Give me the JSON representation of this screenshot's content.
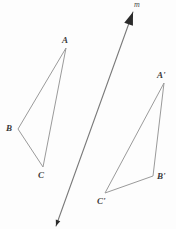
{
  "diagram": {
    "kind": "reflection-diagram",
    "background_color": "#fdfdfd",
    "stroke_colors": {
      "triangle": "#9a9a9a",
      "mirror_line": "#7a7a7a",
      "arrowhead": "#2b2b2b",
      "label": "#3a3a3a"
    },
    "mirror_line": {
      "name": "m",
      "label": "m",
      "label_x": 134,
      "label_y": 1,
      "x1": 56,
      "y1": 226,
      "x2": 133,
      "y2": 12,
      "stroke_width": 1.1
    },
    "pre_image": {
      "name": "triangle-abc",
      "vertices": [
        {
          "label": "A",
          "x": 66,
          "y": 48,
          "label_x": 62,
          "label_y": 36
        },
        {
          "label": "B",
          "x": 18,
          "y": 129,
          "label_x": 6,
          "label_y": 124
        },
        {
          "label": "C",
          "x": 43,
          "y": 167,
          "label_x": 38,
          "label_y": 171
        }
      ],
      "stroke_width": 1
    },
    "image": {
      "name": "triangle-a-prime-b-prime-c-prime",
      "vertices": [
        {
          "label": "A'",
          "x": 164,
          "y": 83,
          "label_x": 157,
          "label_y": 71
        },
        {
          "label": "B'",
          "x": 153,
          "y": 176,
          "label_x": 157,
          "label_y": 172
        },
        {
          "label": "C'",
          "x": 105,
          "y": 193,
          "label_x": 97,
          "label_y": 197
        }
      ],
      "stroke_width": 1
    }
  }
}
